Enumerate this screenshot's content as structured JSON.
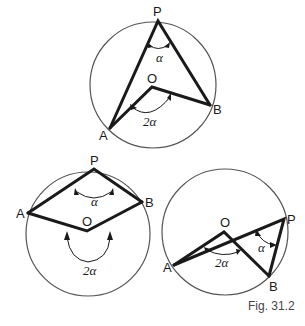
{
  "caption": "Fig. 31.2",
  "figures": [
    {
      "id": "top",
      "labels": {
        "P": "P",
        "O": "O",
        "A": "A",
        "B": "B",
        "alpha": "α",
        "two_alpha": "2α"
      }
    },
    {
      "id": "bottom-left",
      "labels": {
        "P": "P",
        "O": "O",
        "A": "A",
        "B": "B",
        "alpha": "α",
        "two_alpha": "2α"
      }
    },
    {
      "id": "bottom-right",
      "labels": {
        "P": "P",
        "O": "O",
        "A": "A",
        "B": "B",
        "alpha": "α",
        "two_alpha": "2α"
      }
    }
  ],
  "colors": {
    "stroke": "#1a1a1a",
    "circle": "#555555",
    "caption": "#444444"
  }
}
